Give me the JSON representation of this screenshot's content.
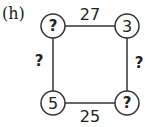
{
  "label": "(h)",
  "nodes": {
    "top_left": "?",
    "top_right": "3",
    "bottom_left": "5",
    "bottom_right": "?"
  },
  "edges": {
    "top": "27",
    "right": "?",
    "bottom": "25",
    "left": "?"
  },
  "colors": {
    "stroke": "#333333",
    "text": "#222222",
    "background": "#ffffff"
  }
}
